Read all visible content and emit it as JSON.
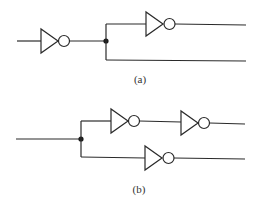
{
  "diagrams": [
    {
      "id": "a",
      "caption": "(a)",
      "description": "Inverter followed by a fan-out junction; upper branch passes through a second inverter, lower branch is a plain wire."
    },
    {
      "id": "b",
      "caption": "(b)",
      "description": "Input wire fans out at a junction; upper branch passes through two inverters in series, lower branch through one inverter."
    }
  ],
  "icons": {
    "gate": "inverter-not-gate",
    "junction": "junction-dot"
  },
  "colors": {
    "stroke": "#2a2a2a",
    "background": "#ffffff"
  }
}
